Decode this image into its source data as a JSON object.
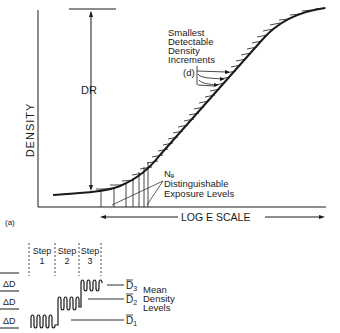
{
  "diagram": {
    "top": {
      "y_axis_label": "DENSITY",
      "dr_label": "DR",
      "annotation_title_lines": [
        "Smallest",
        "Detectable",
        "Density",
        "Increments"
      ],
      "d_label": "(d)",
      "ne_label": "Nₑ",
      "ne_lines": [
        "Distinguishable",
        "Exposure Levels"
      ],
      "x_axis_label": "LOG E SCALE",
      "panel_label": "(a)"
    },
    "bottom": {
      "steps": [
        {
          "line1": "Step",
          "line2": "1"
        },
        {
          "line1": "Step",
          "line2": "2"
        },
        {
          "line1": "Step",
          "line2": "3"
        }
      ],
      "delta_labels": [
        "ΔD",
        "ΔD",
        "ΔD"
      ],
      "levels": [
        "D3",
        "D2",
        "D1"
      ],
      "levels_sub": [
        "3",
        "2",
        "1"
      ],
      "mean_lines": [
        "Mean",
        "Density",
        "Levels"
      ]
    }
  }
}
